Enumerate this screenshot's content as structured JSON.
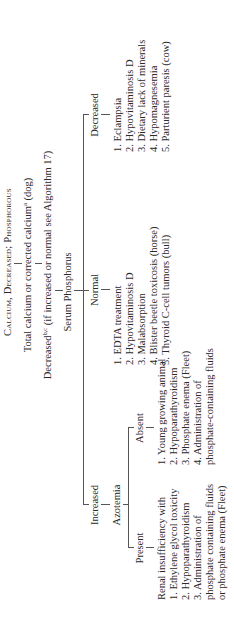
{
  "title": "Calcium, Decreased; Phosphorous",
  "step1": {
    "text": "Total calcium or corrected calcium",
    "sup": "a",
    "suffix": " (dog)"
  },
  "step2": {
    "text": "Decreased",
    "sup": "b,c",
    "suffix": " (if increased or normal see Algorithm 17)"
  },
  "step3": {
    "text": "Serum Phosphorus"
  },
  "branches": {
    "increased": {
      "label": "Increased",
      "sub": "Azotemia",
      "present": {
        "label": "Present",
        "items": [
          "Renal insufficiency with",
          "1. Ethylene glycol toxicity",
          "2. Hypoparathyroidism",
          "3. Administration of",
          "phosphate containing fluids",
          "or phosphate enema (Fleet)"
        ]
      },
      "absent": {
        "label": "Absent",
        "items": [
          "1. Young growing animal",
          "2. Hypoparathyroidism",
          "3. Phosphate enema (Fleet)",
          "4. Administration of",
          "phosphate-containing fluids"
        ]
      }
    },
    "normal": {
      "label": "Normal",
      "items": [
        "1. EDTA treatment",
        "2. Hypovitaminosis D",
        "3. Malabsorption",
        "4. Blister beetle toxicosis (horse)",
        "5. Thyroid C-cell tumors (bull)"
      ]
    },
    "decreased": {
      "label": "Decreased",
      "items": [
        "1. Eclampsia",
        "2. Hypovitaminosis D",
        "3. Dietary lack of minerals",
        "4. Hypomagnesemia",
        "5. Parturient paresis (cow)"
      ]
    }
  }
}
